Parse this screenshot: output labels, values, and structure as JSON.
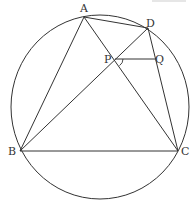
{
  "diagram": {
    "type": "geometry-cyclic-quadrilateral",
    "circle": {
      "cx": 100,
      "cy": 107,
      "rx": 89,
      "ry": 92
    },
    "points": {
      "A": {
        "label": "A",
        "x": 84,
        "y": 17,
        "lx": 80,
        "ly": 12
      },
      "B": {
        "label": "B",
        "x": 20,
        "y": 151,
        "lx": 8,
        "ly": 155
      },
      "C": {
        "label": "C",
        "x": 178,
        "y": 151,
        "lx": 181,
        "ly": 155
      },
      "D": {
        "label": "D",
        "x": 148,
        "y": 28,
        "lx": 146,
        "ly": 27
      },
      "P": {
        "label": "P",
        "x": 115,
        "y": 59,
        "lx": 104,
        "ly": 63
      },
      "Q": {
        "label": "Q",
        "x": 155,
        "y": 59,
        "lx": 155,
        "ly": 63
      }
    },
    "segments": [
      [
        "A",
        "B"
      ],
      [
        "A",
        "C"
      ],
      [
        "A",
        "D"
      ],
      [
        "B",
        "C"
      ],
      [
        "B",
        "D"
      ],
      [
        "D",
        "C"
      ],
      [
        "P",
        "Q"
      ]
    ],
    "angle_mark": {
      "at": "P",
      "between": [
        "Q",
        "C"
      ]
    },
    "line_color": "#333333"
  }
}
